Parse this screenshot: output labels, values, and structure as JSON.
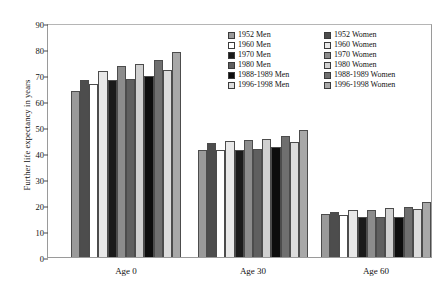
{
  "chart_data": {
    "type": "bar",
    "title": "",
    "xlabel": "",
    "ylabel": "Further life expectancy in years",
    "ylim": [
      0,
      90
    ],
    "yticks": [
      0,
      10,
      20,
      30,
      40,
      50,
      60,
      70,
      80,
      90
    ],
    "grid": false,
    "legend_position": "top-right",
    "categories": [
      "Age 0",
      "Age 30",
      "Age 60"
    ],
    "series": [
      {
        "name": "1952 Men",
        "color": "#9a9a9a",
        "values": [
          64.0,
          41.0,
          16.5
        ]
      },
      {
        "name": "1952 Women",
        "color": "#4d4d4d",
        "values": [
          68.2,
          43.7,
          17.5
        ]
      },
      {
        "name": "1960 Men",
        "color": "#ffffff",
        "values": [
          66.5,
          41.0,
          16.3
        ]
      },
      {
        "name": "1960 Women",
        "color": "#e8e8e8",
        "values": [
          71.5,
          44.7,
          18.0
        ]
      },
      {
        "name": "1970 Men",
        "color": "#1a1a1a",
        "values": [
          67.9,
          41.0,
          15.2
        ]
      },
      {
        "name": "1970 Women",
        "color": "#8c8c8c",
        "values": [
          73.3,
          44.9,
          18.2
        ]
      },
      {
        "name": "1980 Men",
        "color": "#5f5f5f",
        "values": [
          68.6,
          41.7,
          15.4
        ]
      },
      {
        "name": "1980 Women",
        "color": "#d0d0d0",
        "values": [
          74.3,
          45.4,
          18.9
        ]
      },
      {
        "name": "1988-1989 Men",
        "color": "#0d0d0d",
        "values": [
          69.7,
          42.5,
          15.5
        ]
      },
      {
        "name": "1988-1989 Women",
        "color": "#6f6f6f",
        "values": [
          75.9,
          46.6,
          19.3
        ]
      },
      {
        "name": "1996-1998 Men",
        "color": "#dcdcdc",
        "values": [
          72.1,
          44.3,
          18.6
        ]
      },
      {
        "name": "1996-1998 Women",
        "color": "#a8a8a8",
        "values": [
          78.9,
          49.0,
          21.3
        ]
      }
    ]
  }
}
